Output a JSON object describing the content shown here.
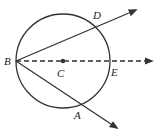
{
  "diagram": {
    "title": "",
    "colors": {
      "stroke": "#333333",
      "background": "#ffffff"
    },
    "circle": {
      "center_label": "C",
      "cx": 63,
      "cy": 61,
      "r": 47
    },
    "points": {
      "B": {
        "label": "B",
        "x": 16,
        "y": 61
      },
      "C": {
        "label": "C",
        "x": 63,
        "y": 61
      },
      "D": {
        "label": "D",
        "x": 97,
        "y": 27
      },
      "E": {
        "label": "E",
        "x": 110,
        "y": 61
      },
      "A": {
        "label": "A",
        "x": 79,
        "y": 107
      }
    },
    "rays": [
      {
        "name": "ray-BD",
        "from": "B",
        "through": "D",
        "style": "solid"
      },
      {
        "name": "ray-BE",
        "from": "B",
        "through": "E",
        "style": "dashed"
      },
      {
        "name": "ray-BA",
        "from": "B",
        "through": "A",
        "style": "solid"
      }
    ]
  }
}
